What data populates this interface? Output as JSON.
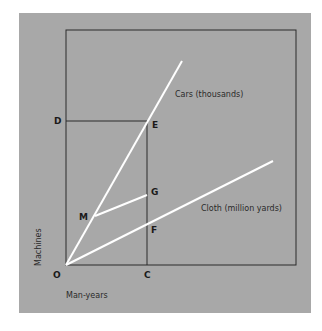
{
  "diagram": {
    "background_color": "#a8a8a8",
    "line_color": "#ffffff",
    "frame_color": "#2a2a2a",
    "axes": {
      "x_label": "Man-years",
      "y_label": "Machines"
    },
    "points": {
      "O": "O",
      "C": "C",
      "D": "D",
      "E": "E",
      "G": "G",
      "F": "F",
      "M": "M"
    },
    "lines": {
      "cars": "Cars (thousands)",
      "cloth": "Cloth (million yards)"
    }
  }
}
